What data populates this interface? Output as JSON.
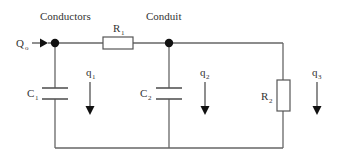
{
  "diagram": {
    "type": "equivalent-circuit",
    "labels": {
      "conductors": "Conductors",
      "conduit": "Conduit",
      "input_flow": "Q",
      "input_flow_sub": "o",
      "r1": "R",
      "r1_sub": "1",
      "r2": "R",
      "r2_sub": "2",
      "c1": "C",
      "c1_sub": "1",
      "c2": "C",
      "c2_sub": "2",
      "q1": "q",
      "q1_sub": "1",
      "q2": "q",
      "q2_sub": "2",
      "q3": "q",
      "q3_sub": "3"
    },
    "components": [
      {
        "id": "R1",
        "kind": "resistor",
        "orientation": "horizontal"
      },
      {
        "id": "R2",
        "kind": "resistor",
        "orientation": "vertical"
      },
      {
        "id": "C1",
        "kind": "capacitor"
      },
      {
        "id": "C2",
        "kind": "capacitor"
      }
    ],
    "nodes": [
      "conductors-node",
      "conduit-node"
    ],
    "colors": {
      "wire": "#666666",
      "node": "#111111",
      "text": "#333333"
    }
  }
}
